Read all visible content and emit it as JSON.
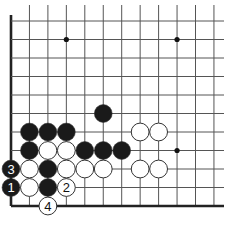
{
  "board": {
    "cols": 12,
    "rows": 11,
    "origin_x": 11,
    "origin_y": 21,
    "spacing_x": 18.45,
    "spacing_y": 18.5,
    "edges": [
      "left",
      "bottom"
    ],
    "star_points": [
      [
        3,
        1
      ],
      [
        9,
        1
      ],
      [
        9,
        7
      ]
    ],
    "colors": {
      "line": "#555555",
      "edge": "#222222",
      "black": "#1a1a1a",
      "white": "#ffffff",
      "stroke": "#333333"
    }
  },
  "stones": [
    {
      "color": "black",
      "col": 5,
      "row": 5
    },
    {
      "color": "black",
      "col": 1,
      "row": 6
    },
    {
      "color": "black",
      "col": 2,
      "row": 6
    },
    {
      "color": "black",
      "col": 3,
      "row": 6
    },
    {
      "color": "white",
      "col": 7,
      "row": 6
    },
    {
      "color": "white",
      "col": 8,
      "row": 6
    },
    {
      "color": "black",
      "col": 1,
      "row": 7
    },
    {
      "color": "white",
      "col": 2,
      "row": 7
    },
    {
      "color": "white",
      "col": 3,
      "row": 7
    },
    {
      "color": "black",
      "col": 4,
      "row": 7
    },
    {
      "color": "black",
      "col": 5,
      "row": 7
    },
    {
      "color": "black",
      "col": 6,
      "row": 7
    },
    {
      "color": "black",
      "col": 0,
      "row": 8,
      "label": "3"
    },
    {
      "color": "white",
      "col": 1,
      "row": 8
    },
    {
      "color": "black",
      "col": 2,
      "row": 8
    },
    {
      "color": "white",
      "col": 3,
      "row": 8
    },
    {
      "color": "white",
      "col": 4,
      "row": 8
    },
    {
      "color": "white",
      "col": 5,
      "row": 8
    },
    {
      "color": "white",
      "col": 7,
      "row": 8
    },
    {
      "color": "white",
      "col": 8,
      "row": 8
    },
    {
      "color": "black",
      "col": 0,
      "row": 9,
      "label": "1"
    },
    {
      "color": "white",
      "col": 1,
      "row": 9
    },
    {
      "color": "black",
      "col": 2,
      "row": 9
    },
    {
      "color": "white",
      "col": 3,
      "row": 9,
      "label": "2"
    },
    {
      "color": "white",
      "col": 2,
      "row": 10,
      "label": "4"
    }
  ]
}
